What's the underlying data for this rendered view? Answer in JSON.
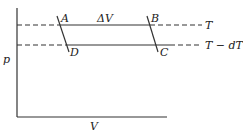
{
  "diagram": {
    "type": "p-V diagram with two isotherms and a cycle ABCD",
    "axes": {
      "y_label": "p",
      "x_label": "V"
    },
    "isotherms": [
      {
        "label": "T"
      },
      {
        "label": "T − dT"
      }
    ],
    "points": [
      "A",
      "B",
      "C",
      "D"
    ],
    "annotation": "ΔV"
  }
}
